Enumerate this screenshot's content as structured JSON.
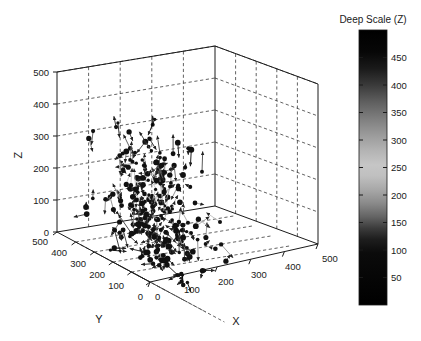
{
  "figure": {
    "background_color": "#ffffff",
    "foreground_color": "#1a1a1a",
    "width": 421,
    "height": 341
  },
  "chart_data": {
    "type": "scatter",
    "subtype": "quiver3d-vector-field",
    "title": "",
    "xlabel": "X",
    "ylabel": "Y",
    "zlabel": "Z",
    "xlim": [
      0,
      500
    ],
    "ylim": [
      0,
      500
    ],
    "zlim": [
      0,
      500
    ],
    "xticks": [
      0,
      100,
      200,
      300,
      400,
      500
    ],
    "yticks": [
      0,
      100,
      200,
      300,
      400,
      500
    ],
    "zticks": [
      0,
      100,
      200,
      300,
      400,
      500
    ],
    "xticklabels": [
      "0",
      "100",
      "200",
      "300",
      "400",
      "500"
    ],
    "yticklabels": [
      "500",
      "400",
      "300",
      "200",
      "100",
      "0"
    ],
    "zticklabels": [
      "0",
      "100",
      "200",
      "300",
      "400",
      "500"
    ],
    "grid": true,
    "grid_style": "dashed",
    "legend": "none",
    "marker": "filled-circle",
    "marker_color": "#111111",
    "arrow_color": "#222222",
    "n_vectors": 240,
    "colormap": "gray-inverted-bowtie",
    "colorbar": {
      "title": "Deep Scale (Z)",
      "orientation": "vertical",
      "position": "right",
      "ticks": [
        50,
        100,
        150,
        200,
        250,
        300,
        350,
        400,
        450
      ],
      "ticklabels": [
        "50",
        "100",
        "150",
        "200",
        "250",
        "300",
        "350",
        "400",
        "450"
      ],
      "range": [
        0,
        500
      ],
      "gradient_stops": [
        {
          "value": 500,
          "color": "#000000"
        },
        {
          "value": 460,
          "color": "#070707"
        },
        {
          "value": 430,
          "color": "#1a1a1a"
        },
        {
          "value": 400,
          "color": "#3a3a3a"
        },
        {
          "value": 370,
          "color": "#5e5e5e"
        },
        {
          "value": 340,
          "color": "#7d7d7d"
        },
        {
          "value": 310,
          "color": "#9a9a9a"
        },
        {
          "value": 280,
          "color": "#b4b4b4"
        },
        {
          "value": 255,
          "color": "#c6c6c6"
        },
        {
          "value": 235,
          "color": "#c0c0c0"
        },
        {
          "value": 210,
          "color": "#a8a8a8"
        },
        {
          "value": 185,
          "color": "#8a8a8a"
        },
        {
          "value": 160,
          "color": "#636363"
        },
        {
          "value": 140,
          "color": "#3c3c3c"
        },
        {
          "value": 120,
          "color": "#1e1e1e"
        },
        {
          "value": 95,
          "color": "#0b0b0b"
        },
        {
          "value": 0,
          "color": "#000000"
        }
      ]
    }
  },
  "axes": {
    "z_label": "Z",
    "y_label": "Y",
    "x_label": "X",
    "z_ticklabels": [
      "500",
      "400",
      "300",
      "200",
      "100",
      "0"
    ],
    "y_ticklabels": [
      "500",
      "400",
      "300",
      "200",
      "100",
      "0"
    ],
    "x_ticklabels": [
      "0",
      "100",
      "200",
      "300",
      "400",
      "500"
    ]
  },
  "colorbar": {
    "title": "Deep Scale (Z)",
    "ticklabels": [
      "450",
      "400",
      "350",
      "300",
      "250",
      "200",
      "150",
      "100",
      "50"
    ]
  }
}
